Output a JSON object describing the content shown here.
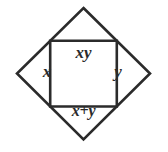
{
  "figure": {
    "type": "diamond-grid-diagram",
    "background_color": "#ffffff",
    "line_color": "#2b2b2b",
    "line_width": 2.6,
    "cells": {
      "top": "xy",
      "left": "x",
      "right": "y",
      "bottom": "x+y"
    }
  }
}
